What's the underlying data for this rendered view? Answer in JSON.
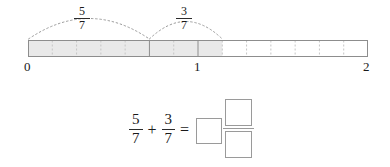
{
  "worksheet": {
    "title": "Fraction addition on a number line"
  },
  "number_line": {
    "start_label": "0",
    "mid_label": "1",
    "end_label": "2",
    "start_value": 0,
    "end_value": 2,
    "denominator": 7,
    "total_segments": 14,
    "shaded_segments": 8,
    "geometry": {
      "x_start": 28,
      "x_one": 198,
      "x_end": 368,
      "bar_top": 40,
      "bar_bottom": 57
    },
    "shading_color": "#e9e9e9",
    "outline_color": "#8d8d8d",
    "tick_color": "#c9c9c9",
    "solid_divider_color": "#8d8d8d",
    "solid_dividers": [
      5,
      7
    ]
  },
  "arcs": [
    {
      "name": "first-jump",
      "numerator": "5",
      "denominator": "7",
      "from_segment": 0,
      "to_segment": 5,
      "color": "#9b9b9b"
    },
    {
      "name": "second-jump",
      "numerator": "3",
      "denominator": "7",
      "from_segment": 5,
      "to_segment": 8,
      "color": "#9b9b9b"
    }
  ],
  "equation": {
    "left_fraction": {
      "numerator": "5",
      "denominator": "7"
    },
    "plus_sign": "+",
    "right_fraction": {
      "numerator": "3",
      "denominator": "7"
    },
    "equals_sign": "=",
    "answer": {
      "whole_value": "",
      "numerator_value": "",
      "denominator_value": "",
      "box_border_color": "#9a9a9a"
    }
  }
}
